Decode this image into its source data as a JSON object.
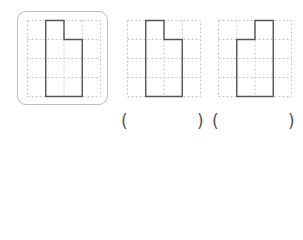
{
  "figures": [
    {
      "id": "reference",
      "highlighted": true,
      "shape": "left-tall"
    },
    {
      "id": "option-a",
      "highlighted": false,
      "shape": "left-tall"
    },
    {
      "id": "option-b",
      "highlighted": false,
      "shape": "right-tall"
    }
  ],
  "grid": {
    "cols": 4,
    "rows": 4
  },
  "answers": [
    {
      "open": "(",
      "close": ")",
      "value": ""
    },
    {
      "open": "(",
      "close": ")",
      "value": ""
    }
  ],
  "colors": {
    "grid": "#c8c8c8",
    "shape": "#555555",
    "frame": "#bdbdbd"
  }
}
